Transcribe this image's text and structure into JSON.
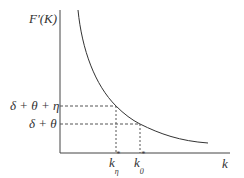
{
  "diagram": {
    "y_axis_label": "F'(K)",
    "x_axis_label": "k",
    "y_ticks": [
      {
        "label": "δ + θ + η",
        "y": 106
      },
      {
        "label": "δ + θ",
        "y": 124
      }
    ],
    "x_ticks": [
      {
        "label": "k",
        "sub": "η",
        "sup": "*",
        "x": 116
      },
      {
        "label": "k",
        "sub": "0",
        "sup": "*",
        "x": 140
      }
    ],
    "curve": "decreasing convex marginal product curve",
    "colors": {
      "line": "#333333",
      "dash": "#555555"
    }
  }
}
